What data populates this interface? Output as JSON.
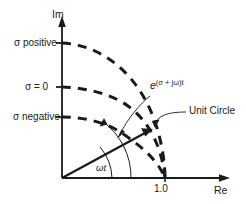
{
  "figure": {
    "axes": {
      "imaginary_label": "Im",
      "real_label": "Re"
    },
    "tick": {
      "unit_value": "1.0"
    },
    "curve_labels": [
      {
        "id": "sigma-positive",
        "text": "σ positive"
      },
      {
        "id": "sigma-zero",
        "text": "σ = 0"
      },
      {
        "id": "sigma-negative",
        "text": "σ negative"
      }
    ],
    "annotations": {
      "exponential_base": "e",
      "exponential_exponent": "(σ + jω)t",
      "unit_circle": "Unit Circle",
      "angle": "ωt"
    },
    "colors": {
      "ink": "#1a1a1a",
      "background": "#ffffff"
    }
  }
}
